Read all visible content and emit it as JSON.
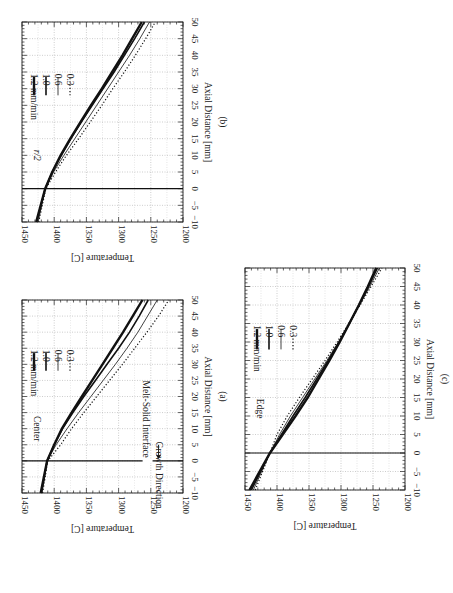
{
  "figure": {
    "orientation": "rotated 90 degrees clockwise",
    "panels": [
      {
        "id": "b",
        "caption": "(b)",
        "annotation": "r/2"
      },
      {
        "id": "a",
        "caption": "(a)",
        "annotation": "Center",
        "interface_label": "Melt-Solid Interface",
        "growth_label": "Growth Direction"
      },
      {
        "id": "c",
        "caption": "(c)",
        "annotation": "Edge"
      }
    ],
    "xlabel": "Axial Distance [mm]",
    "ylabel": "Temperature [C]",
    "x_ticks": [
      "−10",
      "−5",
      "0",
      "5",
      "10",
      "15",
      "20",
      "25",
      "30",
      "35",
      "40",
      "45",
      "50"
    ],
    "y_ticks": [
      "1450",
      "1400",
      "1350",
      "1300",
      "1250",
      "1200"
    ],
    "legend": [
      "1.2 mm/min",
      "1.0",
      "0.6",
      "0.3"
    ]
  },
  "chart_data": [
    {
      "type": "line",
      "title": "(a) Center",
      "xlabel": "Axial Distance [mm]",
      "ylabel": "Temperature [C]",
      "xlim": [
        -10,
        50
      ],
      "ylim": [
        1200,
        1450
      ],
      "grid": true,
      "legend_position": "upper right (rotated)",
      "annotations": [
        "Center",
        "Melt-Solid Interface",
        "Growth Direction",
        "vertical line at x=0"
      ],
      "x": [
        -10,
        0,
        5,
        10,
        15,
        20,
        25,
        30,
        35,
        40,
        45,
        50
      ],
      "series": [
        {
          "name": "1.2 mm/min",
          "values": [
            1421,
            1411,
            1400,
            1388,
            1373,
            1357,
            1341,
            1325,
            1309,
            1293,
            1278,
            1263
          ]
        },
        {
          "name": "1.0",
          "values": [
            1420,
            1411,
            1400,
            1387,
            1371,
            1354,
            1336,
            1318,
            1300,
            1283,
            1268,
            1254
          ]
        },
        {
          "name": "0.6",
          "values": [
            1419,
            1411,
            1397,
            1380,
            1362,
            1343,
            1324,
            1305,
            1287,
            1270,
            1255,
            1240
          ]
        },
        {
          "name": "0.3",
          "values": [
            1418,
            1410,
            1390,
            1373,
            1354,
            1334,
            1314,
            1294,
            1275,
            1256,
            1238,
            1222
          ]
        }
      ]
    },
    {
      "type": "line",
      "title": "(b) r/2",
      "xlabel": "Axial Distance [mm]",
      "ylabel": "Temperature [C]",
      "xlim": [
        -10,
        50
      ],
      "ylim": [
        1200,
        1450
      ],
      "grid": true,
      "legend_position": "upper right (rotated)",
      "annotations": [
        "r/2",
        "vertical line at x=0"
      ],
      "x": [
        -10,
        0,
        5,
        10,
        15,
        20,
        25,
        30,
        35,
        40,
        45,
        50
      ],
      "series": [
        {
          "name": "1.2 mm/min",
          "values": [
            1428,
            1414,
            1403,
            1390,
            1375,
            1359,
            1343,
            1326,
            1310,
            1294,
            1279,
            1264
          ]
        },
        {
          "name": "1.0",
          "values": [
            1427,
            1414,
            1403,
            1389,
            1374,
            1358,
            1341,
            1324,
            1307,
            1291,
            1275,
            1260
          ]
        },
        {
          "name": "0.6",
          "values": [
            1425,
            1414,
            1401,
            1385,
            1368,
            1351,
            1334,
            1317,
            1300,
            1283,
            1267,
            1252
          ]
        },
        {
          "name": "0.3",
          "values": [
            1424,
            1413,
            1398,
            1381,
            1362,
            1344,
            1326,
            1309,
            1291,
            1274,
            1258,
            1243
          ]
        }
      ]
    },
    {
      "type": "line",
      "title": "(c) Edge",
      "xlabel": "Axial Distance [mm]",
      "ylabel": "Temperature [C]",
      "xlim": [
        -10,
        50
      ],
      "ylim": [
        1200,
        1450
      ],
      "grid": true,
      "legend_position": "upper right (rotated)",
      "annotations": [
        "Edge",
        "vertical line at x=0"
      ],
      "x": [
        -10,
        0,
        5,
        10,
        15,
        20,
        25,
        30,
        35,
        40,
        45,
        50
      ],
      "series": [
        {
          "name": "1.2 mm/min",
          "values": [
            1443,
            1411,
            1391,
            1371,
            1352,
            1335,
            1318,
            1302,
            1287,
            1272,
            1258,
            1245
          ]
        },
        {
          "name": "1.0",
          "values": [
            1440,
            1411,
            1393,
            1375,
            1356,
            1338,
            1320,
            1303,
            1287,
            1272,
            1257,
            1243
          ]
        },
        {
          "name": "0.6",
          "values": [
            1437,
            1411,
            1396,
            1379,
            1360,
            1341,
            1322,
            1304,
            1287,
            1271,
            1255,
            1240
          ]
        },
        {
          "name": "0.3",
          "values": [
            1434,
            1411,
            1400,
            1384,
            1365,
            1345,
            1325,
            1306,
            1288,
            1270,
            1253,
            1236
          ]
        }
      ]
    }
  ]
}
